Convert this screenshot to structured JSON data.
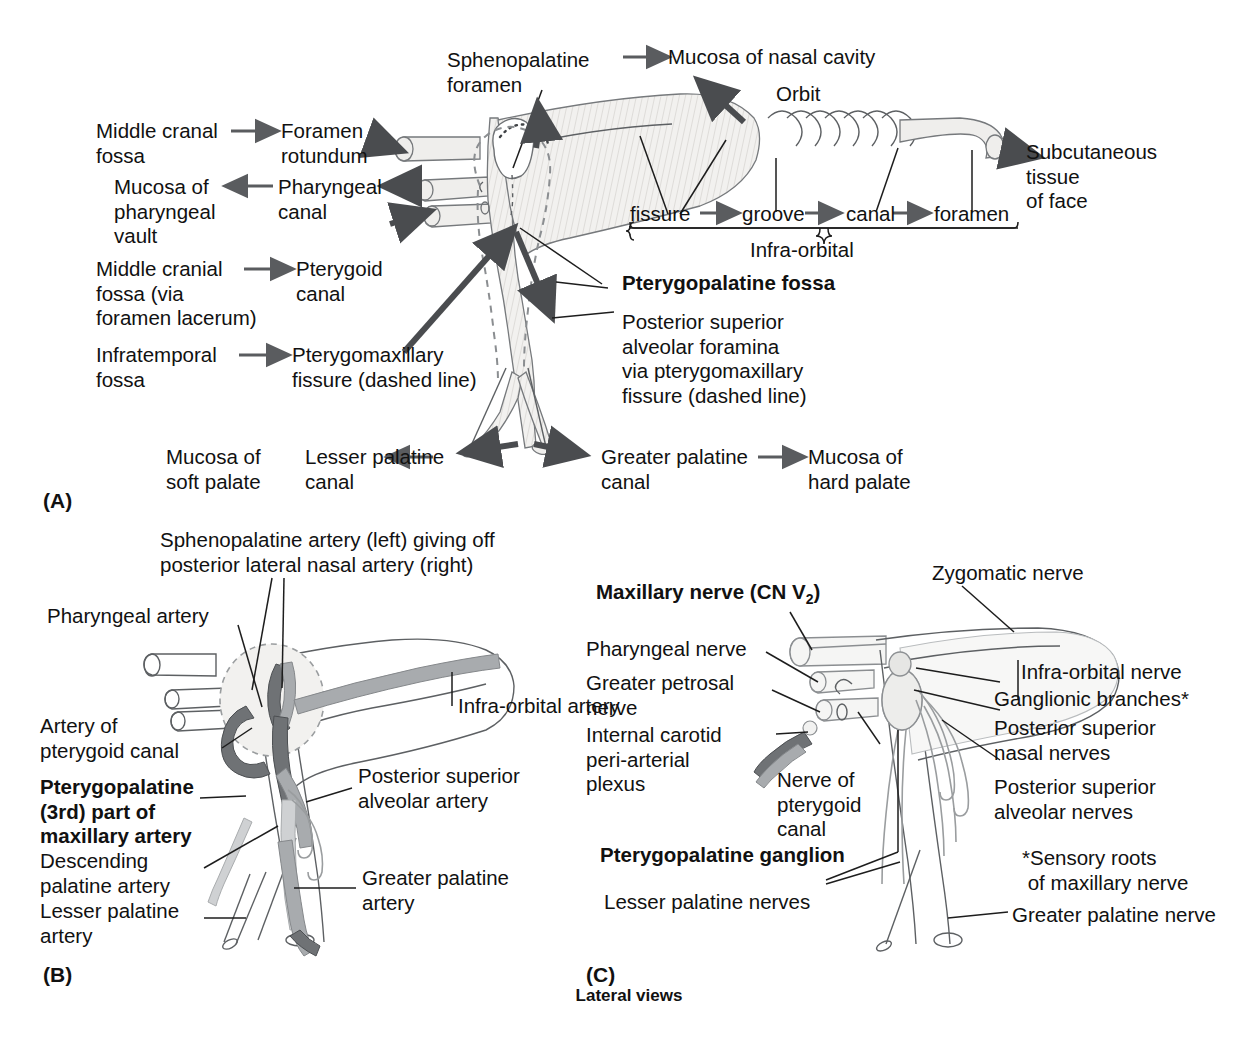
{
  "figure": {
    "panels": [
      {
        "id": "A",
        "label": "(A)"
      },
      {
        "id": "B",
        "label": "(B)"
      },
      {
        "id": "C",
        "label": "(C)"
      }
    ],
    "footer_caption": "Lateral views"
  },
  "panelA": {
    "labels": {
      "sphenopalatine_foramen": "Sphenopalatine\nforamen",
      "mucosa_nasal_cavity": "Mucosa of nasal cavity",
      "orbit": "Orbit",
      "middle_cranal_fossa": "Middle cranal\nfossa",
      "foramen_rotundum": "Foramen\nrotundum",
      "mucosa_pharyngeal_vault": "Mucosa of\npharyngeal\nvault",
      "pharyngeal_canal": "Pharyngeal\ncanal",
      "middle_cranial_fossa_lacerum": "Middle cranial\nfossa (via\nforamen lacerum)",
      "pterygoid_canal": "Pterygoid\ncanal",
      "infratemporal_fossa": "Infratemporal\nfossa",
      "pterygomaxillary_fissure": "Pterygomaxillary\nfissure (dashed line)",
      "subcutaneous_tissue_face": "Subcutaneous\ntissue\nof face",
      "pterygopalatine_fossa": "Pterygopalatine fossa",
      "posterior_superior_alveolar_foramina": "Posterior superior\nalveolar foramina\nvia pterygomaxillary\nfissure (dashed line)",
      "mucosa_soft_palate": "Mucosa of\nsoft palate",
      "lesser_palatine_canal": "Lesser palatine\ncanal",
      "greater_palatine_canal": "Greater palatine\ncanal",
      "mucosa_hard_palate": "Mucosa of\nhard palate"
    },
    "infraorbital_chain": {
      "items": [
        "fissure",
        "groove",
        "canal",
        "foramen"
      ],
      "brace_label": "Infra-orbital"
    }
  },
  "panelB": {
    "labels": {
      "sphenopalatine_artery": "Sphenopalatine artery (left) giving off\nposterior lateral nasal artery (right)",
      "pharyngeal_artery": "Pharyngeal artery",
      "infraorbital_artery": "Infra-orbital artery",
      "artery_of_pterygoid_canal": "Artery of\npterygoid canal",
      "pterygopalatine_maxillary_artery": "Pterygopalatine\n(3rd) part of\nmaxillary artery",
      "posterior_superior_alveolar_artery": "Posterior superior\nalveolar artery",
      "descending_palatine_artery": "Descending\npalatine artery",
      "greater_palatine_artery": "Greater palatine\nartery",
      "lesser_palatine_artery": "Lesser palatine\nartery"
    }
  },
  "panelC": {
    "labels": {
      "maxillary_nerve": "Maxillary nerve (CN V",
      "maxillary_nerve_sub": "2",
      "maxillary_nerve_close": ")",
      "zygomatic_nerve": "Zygomatic nerve",
      "pharyngeal_nerve": "Pharyngeal nerve",
      "greater_petrosal_nerve": "Greater petrosal\nnerve",
      "internal_carotid_plexus": "Internal carotid\nperi-arterial\nplexus",
      "nerve_of_pterygoid_canal": "Nerve of\npterygoid\ncanal",
      "pterygopalatine_ganglion": "Pterygopalatine ganglion",
      "lesser_palatine_nerves": "Lesser palatine nerves",
      "infraorbital_nerve": "Infra-orbital nerve",
      "ganglionic_branches": "Ganglionic branches*",
      "posterior_superior_nasal_nerves": "Posterior superior\nnasal nerves",
      "posterior_superior_alveolar_nerves": "Posterior superior\nalveolar nerves",
      "sensory_roots_note": "*Sensory roots\n of maxillary nerve",
      "greater_palatine_nerve": "Greater palatine nerve"
    }
  },
  "colors": {
    "background": "#ffffff",
    "text": "#111111",
    "bone_fill": "#efeeec",
    "bone_stroke": "#76797c",
    "artery_dark": "#6f7275",
    "artery_mid": "#a8abae",
    "leader": "#1d1d1d"
  }
}
